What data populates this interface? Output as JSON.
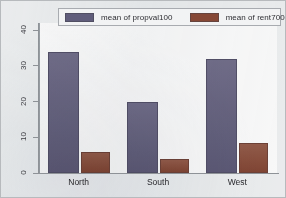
{
  "chart_data": {
    "type": "bar",
    "title": "",
    "subtitle": "",
    "xlabel": "",
    "ylabel": "",
    "categories": [
      "North",
      "South",
      "West"
    ],
    "series": [
      {
        "name": "mean of propval100",
        "color": "#5f5b7d",
        "values": [
          34,
          20,
          32
        ]
      },
      {
        "name": "mean of rent700",
        "color": "#8b4530",
        "values": [
          6,
          4,
          8.5
        ]
      }
    ],
    "ylim": [
      0,
      42
    ],
    "yticks": [
      0,
      10,
      20,
      30,
      40
    ],
    "ytick_labels": [
      "0",
      "10",
      "20",
      "30",
      "40"
    ],
    "grid": false,
    "legend_position": "top",
    "orientation": "vertical",
    "grouping": "clustered"
  },
  "legend": {
    "entries": [
      {
        "label": "mean of propval100",
        "swatch_color": "#5f5b7d"
      },
      {
        "label": "mean of rent700",
        "swatch_color": "#8b4530"
      }
    ]
  },
  "axes": {
    "y_tick_labels": [
      "40",
      "30",
      "20",
      "10",
      "0"
    ],
    "x_tick_labels": [
      "North",
      "South",
      "West"
    ]
  },
  "colors": {
    "propval_bar": "#5f5b7d",
    "rent_bar": "#8b4530",
    "plot_background": "#fdfdfd",
    "figure_background": "#eef0f2",
    "axis_line": "#8e9398"
  }
}
